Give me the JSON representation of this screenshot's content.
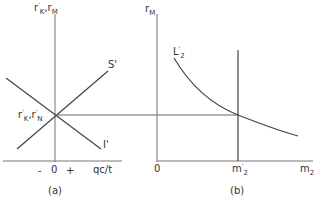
{
  "panel_a": {
    "y_axis_label": "r'K, rM",
    "y_label_main1": "r",
    "y_label_sup1": "'",
    "y_label_sub1": "K",
    "y_label_comma": ",",
    "y_label_main2": "r",
    "y_label_sub2": "M",
    "curve_s_label": "S'",
    "curve_i_label": "I'",
    "eq_label_r1": "r",
    "eq_label_sup1": "'",
    "eq_label_sub1": "K",
    "eq_label_comma": ",",
    "eq_label_r2": "r",
    "eq_label_sup2": "'",
    "eq_label_sub2": "N",
    "x_minus": "-",
    "x_zero": "0",
    "x_plus": "+",
    "x_axis_label": "qc/t",
    "caption": "(a)"
  },
  "panel_b": {
    "y_axis_label_main": "r",
    "y_axis_label_sub": "M",
    "curve_label_main": "L",
    "curve_label_sup": "'",
    "curve_label_sub": "2",
    "origin": "0",
    "tick_label_main": "m",
    "tick_label_sup": "'",
    "tick_label_sub": "2",
    "x_axis_label_main": "m",
    "x_axis_label_sub": "2",
    "caption": "(b)"
  },
  "colors": {
    "line": "#444444",
    "axis": "#666666"
  }
}
